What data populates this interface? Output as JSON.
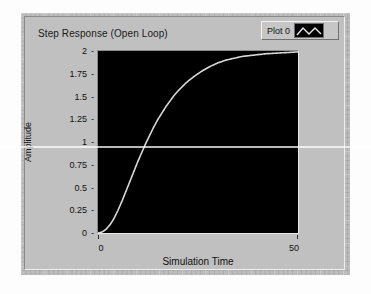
{
  "graph": {
    "title": "Step Response (Open Loop)",
    "legend": {
      "plot_label": "Plot 0",
      "swatch_icon": "zigzag-line-icon",
      "trace_color": "#d8d8d8"
    },
    "background_color": "#000000",
    "panel_color": "#bdbdbd"
  },
  "chart_data": {
    "type": "line",
    "title": "Step Response (Open Loop)",
    "xlabel": "Simulation Time",
    "ylabel": "Amplitude",
    "xlim": [
      0,
      50
    ],
    "ylim": [
      0,
      2
    ],
    "xticks": [
      0,
      50
    ],
    "xticklabels": [
      "0",
      "50"
    ],
    "yticks": [
      0,
      0.25,
      0.5,
      0.75,
      1,
      1.25,
      1.5,
      1.75,
      2
    ],
    "yticklabels": [
      "0",
      "0.25",
      "0.5",
      "0.75",
      "1",
      "1.25",
      "1.5",
      "1.75",
      "2"
    ],
    "grid": false,
    "legend_position": "top-right",
    "series": [
      {
        "name": "Plot 0",
        "color": "#d8d8d8",
        "x": [
          0,
          1,
          2,
          3,
          4,
          5,
          6,
          7,
          8,
          9,
          10,
          11,
          12,
          13,
          14,
          15,
          16,
          17,
          18,
          19,
          20,
          22,
          24,
          26,
          28,
          30,
          32,
          34,
          36,
          38,
          40,
          42,
          44,
          46,
          48,
          50
        ],
        "y": [
          0.0,
          0.01,
          0.04,
          0.09,
          0.16,
          0.25,
          0.35,
          0.46,
          0.57,
          0.68,
          0.79,
          0.89,
          0.99,
          1.08,
          1.17,
          1.25,
          1.32,
          1.39,
          1.45,
          1.51,
          1.56,
          1.65,
          1.72,
          1.78,
          1.83,
          1.87,
          1.9,
          1.92,
          1.94,
          1.95,
          1.96,
          1.97,
          1.975,
          1.98,
          1.985,
          1.99
        ]
      }
    ]
  }
}
